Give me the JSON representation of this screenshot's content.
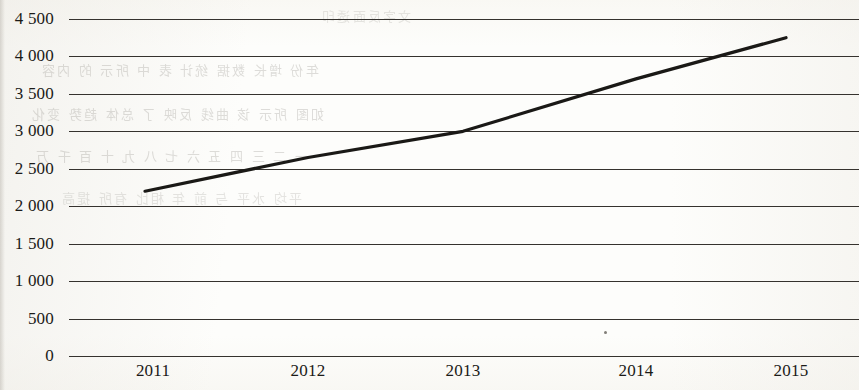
{
  "chart_data": {
    "type": "line",
    "title": "",
    "xlabel": "",
    "ylabel": "",
    "categories": [
      "2011",
      "2012",
      "2013",
      "2014",
      "2015"
    ],
    "values": [
      2200,
      2650,
      3000,
      3700,
      4250
    ],
    "series": [
      {
        "name": "",
        "values": [
          2200,
          2650,
          3000,
          3700,
          4250
        ]
      }
    ],
    "ylim": [
      0,
      4500
    ],
    "y_ticks": [
      0,
      500,
      1000,
      1500,
      2000,
      2500,
      3000,
      3500,
      4000,
      4500
    ],
    "y_tick_labels": [
      "0",
      "500",
      "1 000",
      "1 500",
      "2 000",
      "2 500",
      "3 000",
      "3 500",
      "4 000",
      "4 500"
    ],
    "x_tick_labels": [
      "2011",
      "2012",
      "2013",
      "2014",
      "2015"
    ],
    "grid": "horizontal",
    "legend": "none",
    "line_color": "#1a1916",
    "grid_color": "#35322e",
    "background_color": "#fdfdfb"
  },
  "axes": {
    "y_labels": [
      "4 500",
      "4 000",
      "3 500",
      "3 000",
      "2 500",
      "2 000",
      "1 500",
      "1 000",
      "500",
      "0"
    ],
    "x_labels": [
      "2011",
      "2012",
      "2013",
      "2014",
      "2015"
    ]
  },
  "artifacts": {
    "bleed_text": [
      "文字反面透印",
      "年份 增长 数据 统计 表 中 所示 的 内容",
      "如图 所示 该 曲线 反映 了 总体 趋势 变化",
      "一 二 三 四 五 六 七 八 九 十 百 千 万",
      "平均 水平 与 前 年 相比 有所 提高"
    ],
    "speck": "dust-speck"
  }
}
